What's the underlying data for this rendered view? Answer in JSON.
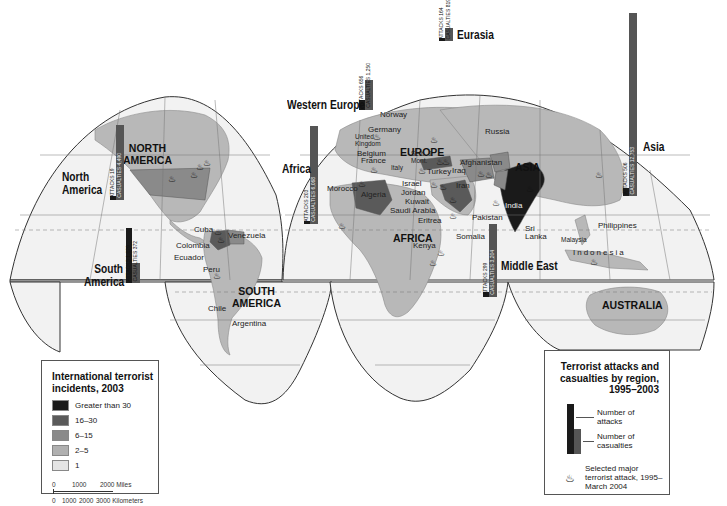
{
  "map": {
    "continents": [
      {
        "id": "north-america",
        "label": "NORTH\nAMERICA"
      },
      {
        "id": "south-america",
        "label": "SOUTH\nAMERICA"
      },
      {
        "id": "europe",
        "label": "EUROPE"
      },
      {
        "id": "africa",
        "label": "AFRICA"
      },
      {
        "id": "asia",
        "label": "ASIA"
      },
      {
        "id": "australia",
        "label": "AUSTRALIA"
      }
    ],
    "countries": [
      "Cuba",
      "Venezuela",
      "Colombia",
      "Ecuador",
      "Peru",
      "Chile",
      "Argentina",
      "Norway",
      "Germany",
      "United Kingdom",
      "Belgium",
      "France",
      "Italy",
      "Serb. & Mont.",
      "Turkey",
      "Iraq",
      "Israel",
      "Jordan",
      "Kuwait",
      "Saudi Arabia",
      "Eritrea",
      "Morocco",
      "Algeria",
      "Iran",
      "Afghanistan",
      "Pakistan",
      "India",
      "Sri Lanka",
      "Russia",
      "Somalia",
      "Kenya",
      "Philippines",
      "Malaysia",
      "Indonesia"
    ],
    "regions": [
      {
        "name": "North America",
        "attacks": "ATTACKS 19",
        "casualties": "CASUALTIES 4,490"
      },
      {
        "name": "South America",
        "attacks": "ATTACKS 1,029",
        "casualties": "CASUALTIES 372"
      },
      {
        "name": "Western Europe",
        "attacks": "ATTACKS 656",
        "casualties": "CASUALTIES 1,250"
      },
      {
        "name": "Eurasia",
        "attacks": "ATTACKS 164",
        "casualties": "CASUALTIES 819"
      },
      {
        "name": "Africa",
        "attacks": "ATTACKS 203",
        "casualties": "CASUALTIES 6,068"
      },
      {
        "name": "Middle East",
        "attacks": "ATTACKS 299",
        "casualties": "CASUALTIES 3,204"
      },
      {
        "name": "Asia",
        "attacks": "ATTACKS 506",
        "casualties": "CASUALTIES 12,753"
      }
    ]
  },
  "legend_incidents": {
    "title": "International terrorist incidents, 2003",
    "items": [
      {
        "label": "Greater than 30",
        "color": "#1a1a1a"
      },
      {
        "label": "16–30",
        "color": "#5a5a5a"
      },
      {
        "label": "6–15",
        "color": "#8a8a8a"
      },
      {
        "label": "2–5",
        "color": "#b0b0b0"
      },
      {
        "label": "1",
        "color": "#e4e4e4"
      }
    ],
    "scale_miles": [
      "0",
      "1000",
      "2000 Miles"
    ],
    "scale_km": [
      "0",
      "1000",
      "2000",
      "3000 Kilometers"
    ]
  },
  "legend_attacks": {
    "title": "Terrorist attacks and casualties by region, 1995–2003",
    "attacks_label": "Number of attacks",
    "casualties_label": "Number of casualties",
    "fire_label": "Selected major terrorist attack, 1995–March 2004"
  },
  "colors": {
    "ocean": "#f2f2f2",
    "land_base": "#b8b8b8",
    "grid": "#777777",
    "outline": "#333333"
  }
}
